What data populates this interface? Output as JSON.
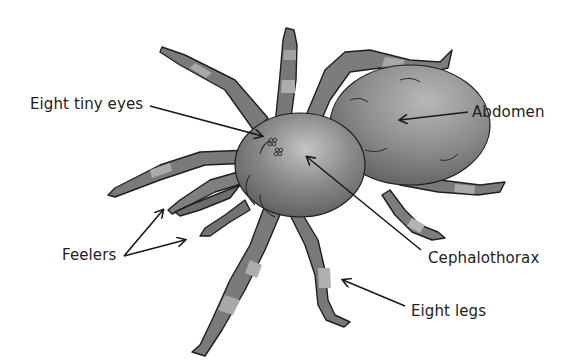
{
  "diagram": {
    "labels": {
      "eyes": "Eight tiny eyes",
      "abdomen": "Abdomen",
      "feelers": "Feelers",
      "cephalothorax": "Cephalothorax",
      "legs": "Eight legs"
    },
    "colors": {
      "background": "#ffffff",
      "text": "#222222",
      "arrow": "#1a1a1a",
      "body_dark": "#5a5a5a",
      "body_mid": "#7d7d7d",
      "body_light": "#a8a8a8",
      "outline": "#1e1e1e"
    }
  }
}
